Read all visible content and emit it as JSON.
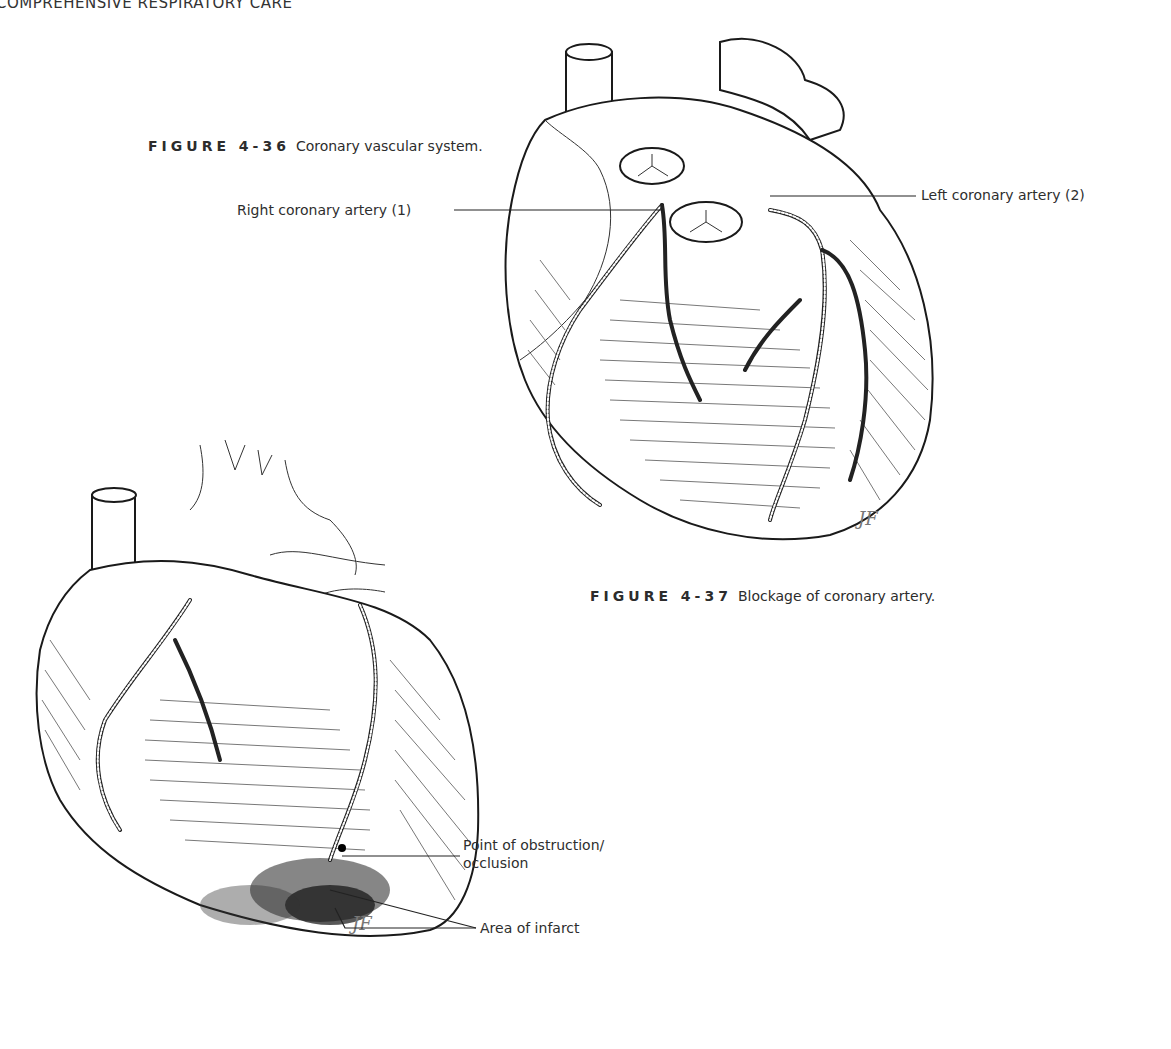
{
  "page": {
    "running_head": "COMPREHENSIVE RESPIRATORY CARE"
  },
  "figure_36": {
    "label": "FIGURE 4-36",
    "caption": "Coronary vascular system.",
    "callouts": {
      "right_coronary": "Right coronary artery (1)",
      "left_coronary": "Left coronary artery (2)"
    },
    "signature": "JF"
  },
  "figure_37": {
    "label": "FIGURE 4-37",
    "caption": "Blockage of coronary artery.",
    "callouts": {
      "obstruction_line1": "Point of obstruction/",
      "obstruction_line2": "occlusion",
      "infarct": "Area of infarct"
    },
    "signature": "JF"
  },
  "colors": {
    "ink": "#1a1a1a",
    "text": "#2c2c2c",
    "background": "#ffffff"
  }
}
